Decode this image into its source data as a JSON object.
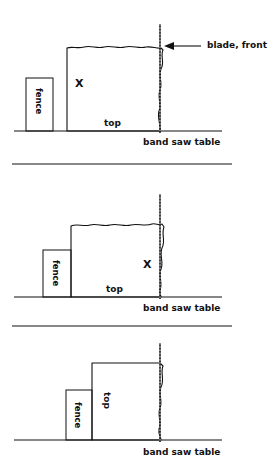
{
  "diagram": {
    "stroke_color": "#111111",
    "background_color": "#ffffff",
    "blade_color": "#111111"
  },
  "labels": {
    "fence": "fence",
    "top": "top",
    "band_saw_table": "band saw table",
    "blade_front": "blade, front",
    "mark_x": "X"
  },
  "panels": [
    {
      "id": "panel-1",
      "caption": "band saw table",
      "fence_label": "fence",
      "top_label": "top",
      "mark_label": "X",
      "mark_position": "left-of-workpiece-upper",
      "has_blade_callout": true,
      "blade_callout": "blade, front",
      "workpiece_top_edge": "wavy",
      "workpiece_right_edge": "wavy",
      "top_label_orientation": "horizontal"
    },
    {
      "id": "panel-2",
      "caption": "band saw table",
      "fence_label": "fence",
      "top_label": "top",
      "mark_label": "X",
      "mark_position": "right-near-blade",
      "has_blade_callout": false,
      "blade_callout": "",
      "workpiece_top_edge": "wavy",
      "workpiece_right_edge": "wavy",
      "top_label_orientation": "horizontal"
    },
    {
      "id": "panel-3",
      "caption": "band saw table",
      "fence_label": "fence",
      "top_label": "top",
      "mark_label": "",
      "mark_position": "none",
      "has_blade_callout": false,
      "blade_callout": "",
      "workpiece_top_edge": "straight",
      "workpiece_right_edge": "wavy",
      "top_label_orientation": "vertical"
    }
  ]
}
